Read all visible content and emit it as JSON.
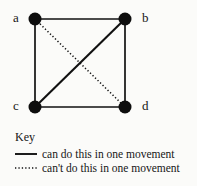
{
  "figure": {
    "type": "diagram",
    "subtype": "graph",
    "background_color": "#fbfbf9",
    "ink_color": "#111111"
  },
  "graph": {
    "nodes": [
      {
        "id": "a",
        "label": "a",
        "cx": 35,
        "cy": 19,
        "label_x": 13,
        "label_y": 11,
        "radius": 6.5
      },
      {
        "id": "b",
        "label": "b",
        "cx": 125,
        "cy": 19,
        "label_x": 142,
        "label_y": 11,
        "radius": 6.5
      },
      {
        "id": "c",
        "label": "c",
        "cx": 35,
        "cy": 107,
        "label_x": 13,
        "label_y": 99,
        "radius": 6.5
      },
      {
        "id": "d",
        "label": "d",
        "cx": 125,
        "cy": 107,
        "label_x": 142,
        "label_y": 99,
        "radius": 6.5
      }
    ],
    "edges": [
      {
        "id": "a-b",
        "from": "a",
        "to": "b",
        "style": "solid",
        "meaning": "can do this in one movement"
      },
      {
        "id": "a-c",
        "from": "a",
        "to": "c",
        "style": "solid",
        "meaning": "can do this in one movement"
      },
      {
        "id": "b-d",
        "from": "b",
        "to": "d",
        "style": "solid",
        "meaning": "can do this in one movement"
      },
      {
        "id": "c-d",
        "from": "c",
        "to": "d",
        "style": "solid",
        "meaning": "can do this in one movement"
      },
      {
        "id": "b-c",
        "from": "b",
        "to": "c",
        "style": "solid",
        "meaning": "can do this in one movement"
      },
      {
        "id": "a-d",
        "from": "a",
        "to": "d",
        "style": "dotted",
        "meaning": "can't do this in one movement"
      }
    ]
  },
  "key": {
    "title": "Key",
    "entries": [
      {
        "style": "solid",
        "label": "can do this in one movement"
      },
      {
        "style": "dotted",
        "label": "can't do this in one movement"
      }
    ]
  }
}
